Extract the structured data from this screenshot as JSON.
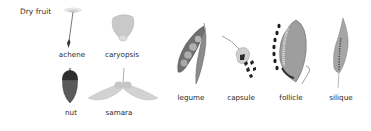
{
  "diagram": {
    "title": "Dry fruit",
    "fruits": [
      {
        "name": "achene",
        "icon": "achene-icon"
      },
      {
        "name": "caryopsis",
        "icon": "caryopsis-icon"
      },
      {
        "name": "nut",
        "icon": "nut-icon"
      },
      {
        "name": "samara",
        "icon": "samara-icon"
      },
      {
        "name": "legume",
        "icon": "legume-icon"
      },
      {
        "name": "capsule",
        "icon": "capsule-icon"
      },
      {
        "name": "follicle",
        "icon": "follicle-icon"
      },
      {
        "name": "silique",
        "icon": "silique-icon"
      }
    ]
  }
}
